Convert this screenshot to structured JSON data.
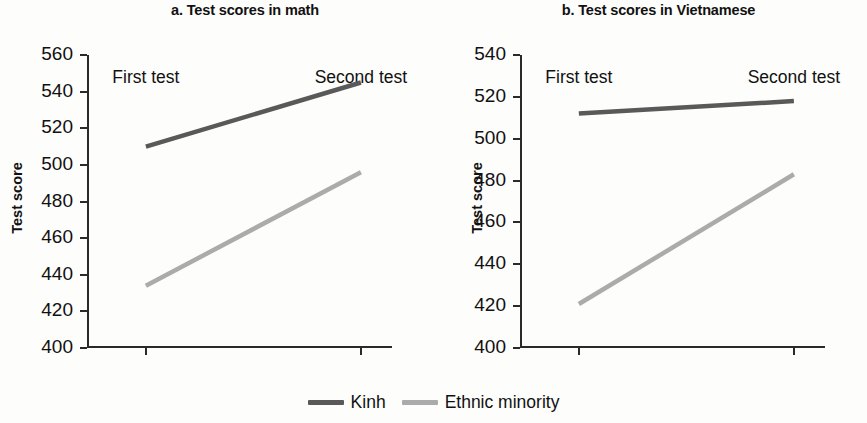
{
  "legend": {
    "position": "bottom-center",
    "items": [
      {
        "label": "Kinh",
        "color": "#595959"
      },
      {
        "label": "Ethnic minority",
        "color": "#ababab"
      }
    ]
  },
  "panels": [
    {
      "id": "a",
      "title": "a. Test scores in math",
      "ylabel": "Test score"
    },
    {
      "id": "b",
      "title": "b. Test scores in Vietnamese",
      "ylabel": "Test score"
    }
  ],
  "chart_data": [
    {
      "type": "line",
      "title": "a. Test scores in math",
      "xlabel": "",
      "ylabel": "Test score",
      "categories": [
        "First test",
        "Second test"
      ],
      "ylim": [
        400,
        560
      ],
      "yticks": [
        400,
        420,
        440,
        460,
        480,
        500,
        520,
        540,
        560
      ],
      "grid": false,
      "legend_position": "bottom-center",
      "series": [
        {
          "name": "Kinh",
          "color": "#595959",
          "values": [
            510,
            545
          ]
        },
        {
          "name": "Ethnic minority",
          "color": "#ababab",
          "values": [
            434,
            496
          ]
        }
      ]
    },
    {
      "type": "line",
      "title": "b. Test scores in Vietnamese",
      "xlabel": "",
      "ylabel": "Test score",
      "categories": [
        "First test",
        "Second test"
      ],
      "ylim": [
        400,
        540
      ],
      "yticks": [
        400,
        420,
        440,
        460,
        480,
        500,
        520,
        540
      ],
      "grid": false,
      "legend_position": "bottom-center",
      "series": [
        {
          "name": "Kinh",
          "color": "#595959",
          "values": [
            512,
            518
          ]
        },
        {
          "name": "Ethnic minority",
          "color": "#ababab",
          "values": [
            421,
            483
          ]
        }
      ]
    }
  ]
}
